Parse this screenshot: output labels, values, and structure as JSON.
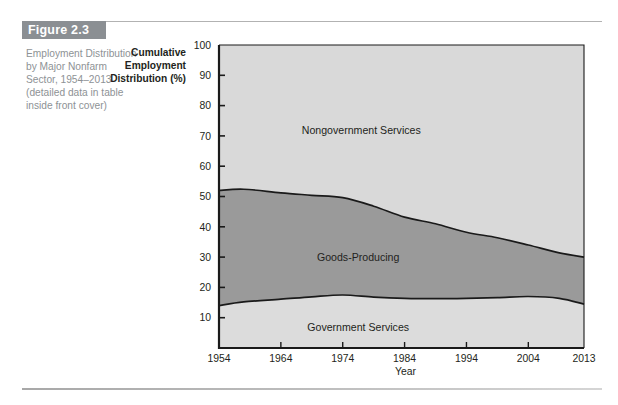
{
  "figure": {
    "badge_label": "Figure 2.3",
    "caption": "Employment Distribution by Major Nonfarm Sector, 1954–2013 (detailed data in table inside front cover)"
  },
  "axis_title": {
    "line1": "Cumulative",
    "line2": "Employment",
    "line3": "Distribution (%)"
  },
  "colors": {
    "badge_background": "#8b8f93",
    "caption_text": "#8e9295",
    "nongovernment_services_fill": "#d9d9d9",
    "goods_producing_fill": "#9a9a9a",
    "government_services_fill": "#dcdcdc",
    "curve_line": "#1a1a1a",
    "axis_line": "#1a1a1a",
    "rule": "#b2b2b2"
  },
  "chart_data": {
    "type": "area",
    "title": "Employment Distribution by Major Nonfarm Sector, 1954–2013",
    "subtitle": "",
    "xlabel": "Year",
    "ylabel": "Cumulative Employment Distribution (%)",
    "xlim": [
      1954,
      2013
    ],
    "ylim": [
      0,
      100
    ],
    "grid": false,
    "legend_position": "inline-labels",
    "stacked": true,
    "xticks": [
      1954,
      1964,
      1974,
      1984,
      1994,
      2004,
      2013
    ],
    "xtick_labels": [
      "1954",
      "1964",
      "1974",
      "1984",
      "1994",
      "2004",
      "2013"
    ],
    "yticks": [
      10,
      20,
      30,
      40,
      50,
      60,
      70,
      80,
      90,
      100
    ],
    "ytick_labels": [
      "10",
      "20",
      "30",
      "40",
      "50",
      "60",
      "70",
      "80",
      "90",
      "100"
    ],
    "x": [
      1954,
      1958,
      1964,
      1969,
      1974,
      1979,
      1984,
      1989,
      1994,
      1999,
      2004,
      2009,
      2013
    ],
    "boundaries": [
      {
        "name": "Government Services (upper boundary)",
        "description": "Cumulative share at top of Government Services band",
        "values": [
          14.0,
          15.2,
          16.1,
          16.9,
          17.5,
          16.8,
          16.4,
          16.3,
          16.4,
          16.6,
          17.0,
          16.4,
          14.5
        ]
      },
      {
        "name": "Goods-Producing (upper boundary)",
        "description": "Cumulative share at top of Goods-Producing band",
        "values": [
          52.0,
          52.4,
          51.2,
          50.4,
          49.6,
          46.8,
          43.2,
          41.0,
          38.2,
          36.4,
          34.0,
          31.4,
          30.0
        ]
      },
      {
        "name": "Nongovernment Services (upper boundary)",
        "description": "Total cumulative distribution, always 100%",
        "values": [
          100,
          100,
          100,
          100,
          100,
          100,
          100,
          100,
          100,
          100,
          100,
          100,
          100
        ]
      }
    ],
    "series": [
      {
        "name": "Government Services",
        "label": "Government Services",
        "label_at": {
          "x": 1976.5,
          "y": 7
        },
        "fill": "#dcdcdc",
        "values": [
          14.0,
          15.2,
          16.1,
          16.9,
          17.5,
          16.8,
          16.4,
          16.3,
          16.4,
          16.6,
          17.0,
          16.4,
          14.5
        ]
      },
      {
        "name": "Goods-Producing",
        "label": "Goods-Producing",
        "label_at": {
          "x": 1976.5,
          "y": 30
        },
        "fill": "#9a9a9a",
        "values": [
          38.0,
          37.2,
          35.1,
          33.5,
          32.1,
          30.0,
          26.8,
          24.7,
          21.8,
          19.8,
          17.0,
          15.0,
          15.5
        ]
      },
      {
        "name": "Nongovernment Services",
        "label": "Nongovernment Services",
        "label_at": {
          "x": 1977,
          "y": 72
        },
        "fill": "#d9d9d9",
        "values": [
          48.0,
          47.6,
          48.8,
          49.6,
          50.4,
          53.2,
          56.8,
          59.0,
          61.8,
          63.6,
          66.0,
          68.6,
          70.0
        ]
      }
    ]
  }
}
